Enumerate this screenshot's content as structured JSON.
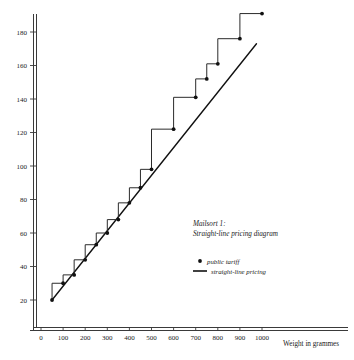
{
  "chart_data": {
    "type": "line",
    "title": "",
    "xlabel": "Weight in grammes",
    "ylabel": "",
    "xlim": [
      0,
      1100
    ],
    "ylim": [
      0,
      196
    ],
    "grid": false,
    "legend_position": "center-right",
    "x_ticks": [
      0,
      100,
      200,
      300,
      400,
      500,
      600,
      700,
      800,
      900,
      1000
    ],
    "x_tick_labels": [
      "0",
      "100",
      "200",
      "300",
      "400",
      "500",
      "600",
      "700",
      "800",
      "900",
      "1000"
    ],
    "y_ticks": [
      20,
      40,
      60,
      80,
      100,
      120,
      140,
      160,
      180
    ],
    "y_tick_labels": [
      "20",
      "40",
      "60",
      "80",
      "100",
      "120",
      "140",
      "160",
      "180"
    ],
    "annotation": {
      "line1": "Mailsort 1:",
      "line2": "Straight-line pricing diagram"
    },
    "legend": [
      {
        "name": "public tariff",
        "marker": "dot"
      },
      {
        "name": "straight-line pricing",
        "marker": "line"
      }
    ],
    "series": [
      {
        "name": "public tariff",
        "type": "step",
        "marker": "dot",
        "points": [
          {
            "x": 50,
            "y": 20
          },
          {
            "x": 100,
            "y": 30
          },
          {
            "x": 150,
            "y": 35
          },
          {
            "x": 200,
            "y": 44
          },
          {
            "x": 250,
            "y": 53
          },
          {
            "x": 300,
            "y": 60
          },
          {
            "x": 350,
            "y": 68
          },
          {
            "x": 400,
            "y": 78
          },
          {
            "x": 450,
            "y": 87
          },
          {
            "x": 500,
            "y": 98
          },
          {
            "x": 600,
            "y": 122
          },
          {
            "x": 700,
            "y": 141
          },
          {
            "x": 750,
            "y": 152
          },
          {
            "x": 800,
            "y": 161
          },
          {
            "x": 900,
            "y": 176
          },
          {
            "x": 1000,
            "y": 191
          }
        ]
      },
      {
        "name": "straight-line pricing",
        "type": "line",
        "points": [
          {
            "x": 50,
            "y": 20
          },
          {
            "x": 975,
            "y": 173
          }
        ]
      }
    ]
  }
}
